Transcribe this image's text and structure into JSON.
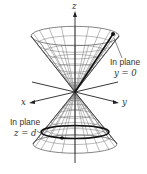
{
  "figure": {
    "axes": {
      "x": "x",
      "y": "y",
      "z": "z"
    },
    "annotations": [
      {
        "line1": "In plane",
        "line2": "y = 0"
      },
      {
        "line1": "In plane",
        "line2": "z = d"
      }
    ],
    "colors": {
      "ink": "#222222",
      "grid": "#555555",
      "background": "#ffffff"
    }
  }
}
